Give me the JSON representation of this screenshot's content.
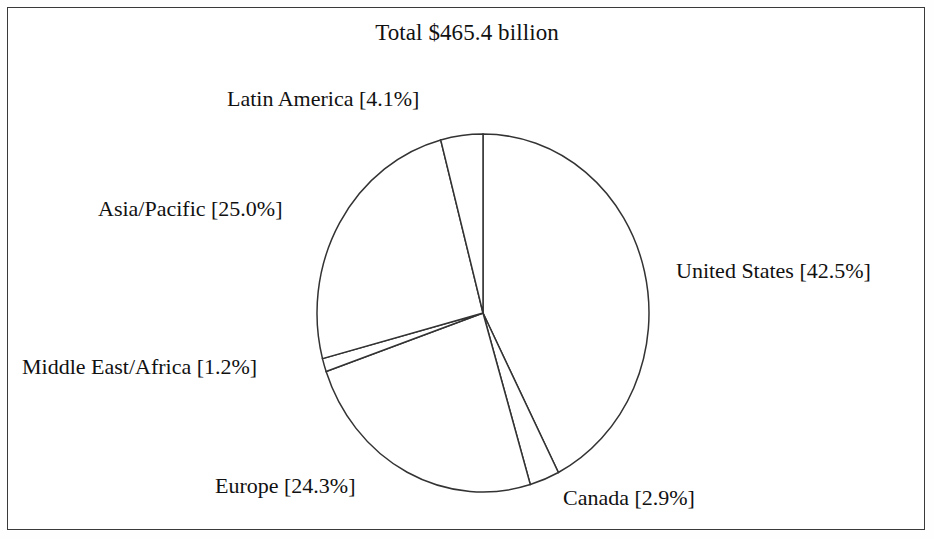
{
  "figure": {
    "width": 934,
    "height": 539,
    "background_color": "#ffffff",
    "border_color": "#3a3a3a",
    "line_color": "#333333"
  },
  "chart_data": {
    "type": "pie",
    "title": "Total $465.4 billion",
    "total_value": 465.4,
    "total_units": "billion USD",
    "xlabel": "",
    "ylabel": "",
    "legend_position": "none",
    "labels_position": "outside-callout",
    "grid": false,
    "start_angle_deg": 0,
    "direction": "clockwise",
    "categories": [
      "United States",
      "Canada",
      "Europe",
      "Middle East/Africa",
      "Asia/Pacific",
      "Latin America"
    ],
    "values": [
      42.5,
      2.9,
      24.3,
      1.2,
      25.0,
      4.1
    ],
    "slices": [
      {
        "name": "United States",
        "percent": 42.5,
        "label": "United States [42.5%]",
        "angle_deg": 153.0,
        "start_deg": 0.0,
        "end_deg": 153.0,
        "color": "#ffffff"
      },
      {
        "name": "Canada",
        "percent": 2.9,
        "label": "Canada [2.9%]",
        "angle_deg": 10.44,
        "start_deg": 153.0,
        "end_deg": 163.44,
        "color": "#ffffff"
      },
      {
        "name": "Europe",
        "percent": 24.3,
        "label": "Europe [24.3%]",
        "angle_deg": 87.48,
        "start_deg": 163.44,
        "end_deg": 250.92,
        "color": "#ffffff"
      },
      {
        "name": "Middle East/Africa",
        "percent": 1.2,
        "label": "Middle East/Africa [1.2%]",
        "angle_deg": 4.32,
        "start_deg": 250.92,
        "end_deg": 255.24,
        "color": "#ffffff"
      },
      {
        "name": "Asia/Pacific",
        "percent": 25.0,
        "label": "Asia/Pacific [25.0%]",
        "angle_deg": 90.0,
        "start_deg": 255.24,
        "end_deg": 345.24,
        "color": "#ffffff"
      },
      {
        "name": "Latin America",
        "percent": 4.1,
        "label": "Latin America [4.1%]",
        "angle_deg": 14.76,
        "start_deg": 345.24,
        "end_deg": 360.0,
        "color": "#ffffff"
      }
    ]
  }
}
